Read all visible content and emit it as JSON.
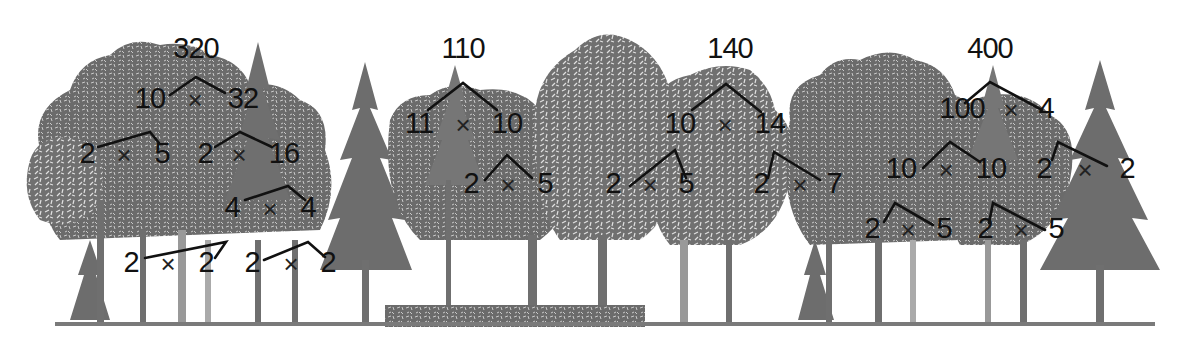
{
  "colors": {
    "trees": "#6d6d6d",
    "tree_light": "#8a8a8a",
    "branch_lines": "#111111",
    "text": "#111111",
    "background": "#ffffff"
  },
  "operator_symbol": "×",
  "factor_trees": [
    {
      "root": "320",
      "nodes": [
        {
          "id": "a",
          "label": "320",
          "x": 196,
          "y": 48
        },
        {
          "id": "b",
          "label": "10",
          "x": 150,
          "y": 98
        },
        {
          "id": "c",
          "label": "32",
          "x": 243,
          "y": 98
        },
        {
          "id": "d",
          "label": "2",
          "x": 87,
          "y": 153
        },
        {
          "id": "e",
          "label": "5",
          "x": 162,
          "y": 153
        },
        {
          "id": "f",
          "label": "2",
          "x": 205,
          "y": 153
        },
        {
          "id": "g",
          "label": "16",
          "x": 284,
          "y": 153
        },
        {
          "id": "h",
          "label": "4",
          "x": 232,
          "y": 207
        },
        {
          "id": "i",
          "label": "4",
          "x": 308,
          "y": 207
        },
        {
          "id": "j",
          "label": "2",
          "x": 131,
          "y": 262
        },
        {
          "id": "k",
          "label": "2",
          "x": 206,
          "y": 262
        },
        {
          "id": "l",
          "label": "2",
          "x": 252,
          "y": 262
        },
        {
          "id": "m",
          "label": "2",
          "x": 328,
          "y": 262
        }
      ],
      "products": [
        {
          "x": 195,
          "y": 100
        },
        {
          "x": 124,
          "y": 155
        },
        {
          "x": 239,
          "y": 155
        },
        {
          "x": 270,
          "y": 209
        },
        {
          "x": 168,
          "y": 264
        },
        {
          "x": 291,
          "y": 264
        }
      ],
      "branches": [
        [
          [
            170,
            95
          ],
          [
            196,
            77
          ],
          [
            225,
            93
          ]
        ],
        [
          [
            98,
            147
          ],
          [
            150,
            132
          ],
          [
            159,
            143
          ]
        ],
        [
          [
            215,
            147
          ],
          [
            240,
            132
          ],
          [
            272,
            147
          ]
        ],
        [
          [
            245,
            200
          ],
          [
            288,
            186
          ],
          [
            305,
            200
          ]
        ],
        [
          [
            145,
            258
          ],
          [
            226,
            242
          ],
          [
            215,
            258
          ]
        ],
        [
          [
            264,
            260
          ],
          [
            308,
            242
          ],
          [
            325,
            257
          ]
        ]
      ]
    },
    {
      "root": "110",
      "nodes": [
        {
          "id": "a",
          "label": "110",
          "x": 463,
          "y": 48
        },
        {
          "id": "b",
          "label": "11",
          "x": 419,
          "y": 123
        },
        {
          "id": "c",
          "label": "10",
          "x": 507,
          "y": 123
        },
        {
          "id": "d",
          "label": "2",
          "x": 471,
          "y": 183
        },
        {
          "id": "e",
          "label": "5",
          "x": 545,
          "y": 183
        }
      ],
      "products": [
        {
          "x": 463,
          "y": 125
        },
        {
          "x": 508,
          "y": 185
        }
      ],
      "branches": [
        [
          [
            428,
            110
          ],
          [
            463,
            83
          ],
          [
            497,
            110
          ]
        ],
        [
          [
            485,
            180
          ],
          [
            507,
            155
          ],
          [
            532,
            178
          ]
        ]
      ]
    },
    {
      "root": "140",
      "nodes": [
        {
          "id": "a",
          "label": "140",
          "x": 730,
          "y": 48
        },
        {
          "id": "b",
          "label": "10",
          "x": 680,
          "y": 123
        },
        {
          "id": "c",
          "label": "14",
          "x": 770,
          "y": 123
        },
        {
          "id": "d",
          "label": "2",
          "x": 613,
          "y": 183
        },
        {
          "id": "e",
          "label": "5",
          "x": 686,
          "y": 183
        },
        {
          "id": "f",
          "label": "2",
          "x": 761,
          "y": 183
        },
        {
          "id": "g",
          "label": "7",
          "x": 834,
          "y": 183
        }
      ],
      "products": [
        {
          "x": 725,
          "y": 125
        },
        {
          "x": 650,
          "y": 185
        },
        {
          "x": 800,
          "y": 185
        }
      ],
      "branches": [
        [
          [
            692,
            110
          ],
          [
            726,
            84
          ],
          [
            761,
            112
          ]
        ],
        [
          [
            630,
            186
          ],
          [
            675,
            150
          ],
          [
            686,
            178
          ]
        ],
        [
          [
            768,
            178
          ],
          [
            774,
            152
          ],
          [
            820,
            180
          ]
        ]
      ]
    },
    {
      "root": "400",
      "nodes": [
        {
          "id": "a",
          "label": "400",
          "x": 990,
          "y": 48
        },
        {
          "id": "b",
          "label": "100",
          "x": 962,
          "y": 108
        },
        {
          "id": "c",
          "label": "4",
          "x": 1046,
          "y": 108
        },
        {
          "id": "d",
          "label": "10",
          "x": 901,
          "y": 168
        },
        {
          "id": "e",
          "label": "10",
          "x": 991,
          "y": 168
        },
        {
          "id": "f",
          "label": "2",
          "x": 1044,
          "y": 168
        },
        {
          "id": "g",
          "label": "2",
          "x": 1127,
          "y": 168
        },
        {
          "id": "h",
          "label": "2",
          "x": 872,
          "y": 228
        },
        {
          "id": "i",
          "label": "5",
          "x": 944,
          "y": 228
        },
        {
          "id": "j",
          "label": "2",
          "x": 985,
          "y": 228
        },
        {
          "id": "k",
          "label": "5",
          "x": 1056,
          "y": 228
        }
      ],
      "products": [
        {
          "x": 1011,
          "y": 110
        },
        {
          "x": 946,
          "y": 170
        },
        {
          "x": 1085,
          "y": 170
        },
        {
          "x": 908,
          "y": 230
        },
        {
          "x": 1021,
          "y": 230
        }
      ],
      "branches": [
        [
          [
            965,
            103
          ],
          [
            990,
            82
          ],
          [
            1042,
            110
          ]
        ],
        [
          [
            923,
            168
          ],
          [
            950,
            142
          ],
          [
            980,
            162
          ]
        ],
        [
          [
            1052,
            160
          ],
          [
            1058,
            142
          ],
          [
            1107,
            166
          ]
        ],
        [
          [
            884,
            222
          ],
          [
            895,
            203
          ],
          [
            933,
            225
          ]
        ],
        [
          [
            989,
            223
          ],
          [
            993,
            203
          ],
          [
            1045,
            230
          ]
        ]
      ]
    }
  ]
}
